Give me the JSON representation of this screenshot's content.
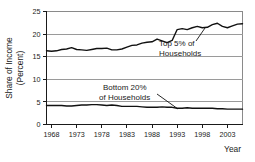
{
  "chart_data": {
    "type": "line",
    "title": "",
    "xlabel": "Year",
    "ylabel_line1": "Share of Income",
    "ylabel_line2": "(Percent)",
    "xlim": [
      1967,
      2006
    ],
    "ylim": [
      0,
      25
    ],
    "yticks": [
      "0",
      "5",
      "10",
      "15",
      "20",
      "25"
    ],
    "ytick_values": [
      0,
      5,
      10,
      15,
      20,
      25
    ],
    "xticks": [
      "1968",
      "1973",
      "1978",
      "1983",
      "1988",
      "1993",
      "1998",
      "2003"
    ],
    "xtick_values": [
      1968,
      1973,
      1978,
      1983,
      1988,
      1993,
      1998,
      2003
    ],
    "grid": true,
    "legend": "none",
    "x": [
      1967,
      1968,
      1969,
      1970,
      1971,
      1972,
      1973,
      1974,
      1975,
      1976,
      1977,
      1978,
      1979,
      1980,
      1981,
      1982,
      1983,
      1984,
      1985,
      1986,
      1987,
      1988,
      1989,
      1990,
      1991,
      1992,
      1993,
      1994,
      1995,
      1996,
      1997,
      1998,
      1999,
      2000,
      2001,
      2002,
      2003,
      2004,
      2005,
      2006
    ],
    "series": [
      {
        "name": "Top 5% of Households",
        "color": "#111111",
        "values": [
          16.3,
          16.2,
          16.3,
          16.6,
          16.7,
          17.0,
          16.6,
          16.5,
          16.4,
          16.6,
          16.8,
          16.8,
          16.9,
          16.5,
          16.5,
          16.7,
          17.1,
          17.5,
          17.6,
          18.0,
          18.2,
          18.3,
          18.9,
          18.5,
          18.1,
          18.6,
          21.0,
          21.2,
          21.0,
          21.4,
          21.7,
          21.4,
          21.5,
          22.1,
          22.4,
          21.7,
          21.4,
          21.8,
          22.2,
          22.3
        ]
      },
      {
        "name": "Bottom 20% of Households",
        "color": "#111111",
        "values": [
          4.2,
          4.2,
          4.2,
          4.2,
          4.1,
          4.1,
          4.2,
          4.3,
          4.3,
          4.4,
          4.4,
          4.3,
          4.2,
          4.3,
          4.2,
          4.0,
          4.0,
          4.0,
          4.0,
          3.9,
          3.8,
          3.8,
          3.8,
          3.9,
          3.8,
          3.8,
          3.6,
          3.6,
          3.7,
          3.6,
          3.6,
          3.6,
          3.6,
          3.6,
          3.5,
          3.5,
          3.4,
          3.4,
          3.4,
          3.4
        ]
      }
    ],
    "annotations": [
      {
        "id": "top-annotation",
        "line1": "Top 5% of",
        "line2": "Households",
        "points_to_series": "Top 5% of Households"
      },
      {
        "id": "bottom-annotation",
        "line1": "Bottom 20%",
        "line2": "of Households",
        "points_to_series": "Bottom 20% of Households"
      }
    ]
  }
}
